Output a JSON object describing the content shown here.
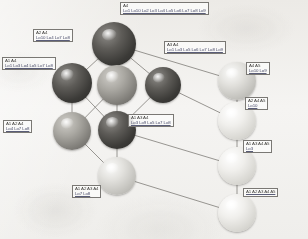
{
  "diagram": {
    "type": "hasse-lattice",
    "background_color": "#f3f2f0",
    "edge_color": "#8c8a86",
    "label_border_color": "#7a7874",
    "node_colors": {
      "dark": "#3b3a37",
      "mid": "#8a8883",
      "light": "#dedcd8",
      "pale": "#efeeeb"
    }
  },
  "nodes": [
    {
      "id": "n-top",
      "shade": "dark",
      "x": 114,
      "y": 44,
      "r": 22
    },
    {
      "id": "n-left-upper",
      "shade": "dark",
      "x": 72,
      "y": 83,
      "r": 20
    },
    {
      "id": "n-center-mid",
      "shade": "mid",
      "x": 117,
      "y": 85,
      "r": 20
    },
    {
      "id": "n-right-mid",
      "shade": "dark",
      "x": 163,
      "y": 85,
      "r": 18
    },
    {
      "id": "n-left-lower",
      "shade": "mid",
      "x": 72,
      "y": 131,
      "r": 19
    },
    {
      "id": "n-center-low",
      "shade": "dark",
      "x": 117,
      "y": 130,
      "r": 19
    },
    {
      "id": "n-bottom-mid",
      "shade": "light",
      "x": 117,
      "y": 176,
      "r": 19
    },
    {
      "id": "n-r1",
      "shade": "light",
      "x": 237,
      "y": 81,
      "r": 19
    },
    {
      "id": "n-r2",
      "shade": "pale",
      "x": 237,
      "y": 121,
      "r": 19
    },
    {
      "id": "n-r3",
      "shade": "pale",
      "x": 237,
      "y": 166,
      "r": 19
    },
    {
      "id": "n-r4",
      "shade": "pale",
      "x": 237,
      "y": 213,
      "r": 19
    }
  ],
  "edges": [
    {
      "from": "n-top",
      "to": "n-left-upper"
    },
    {
      "from": "n-top",
      "to": "n-center-mid"
    },
    {
      "from": "n-top",
      "to": "n-right-mid"
    },
    {
      "from": "n-top",
      "to": "n-r1"
    },
    {
      "from": "n-left-upper",
      "to": "n-left-lower"
    },
    {
      "from": "n-left-upper",
      "to": "n-center-low"
    },
    {
      "from": "n-center-mid",
      "to": "n-left-lower"
    },
    {
      "from": "n-center-mid",
      "to": "n-center-low"
    },
    {
      "from": "n-right-mid",
      "to": "n-center-low"
    },
    {
      "from": "n-right-mid",
      "to": "n-r2"
    },
    {
      "from": "n-left-lower",
      "to": "n-bottom-mid"
    },
    {
      "from": "n-center-low",
      "to": "n-bottom-mid"
    },
    {
      "from": "n-center-low",
      "to": "n-r3"
    },
    {
      "from": "n-bottom-mid",
      "to": "n-r4"
    },
    {
      "from": "n-r1",
      "to": "n-r2"
    },
    {
      "from": "n-r2",
      "to": "n-r3"
    },
    {
      "from": "n-r3",
      "to": "n-r4"
    }
  ],
  "labels": [
    {
      "id": "lbl-top",
      "node": "n-top",
      "attrs": "A4",
      "objs": "Lo1 Lo10 Lo2 Lo3 Lo4 Lo5 Lo6 Lo7 Lo8 Lo9",
      "x": 120,
      "y": 2
    },
    {
      "id": "lbl-a2a4",
      "node": "n-left-upper",
      "attrs": "A2 A4",
      "objs": "Lo10 Lo4 Lo7 Lo8",
      "x": 33,
      "y": 29
    },
    {
      "id": "lbl-a3a4",
      "node": "n-right-mid",
      "attrs": "A3 A4",
      "objs": "Lo1 Lo3 Lo5 Lo6 Lo7 Lo8 Lo9",
      "x": 164,
      "y": 41
    },
    {
      "id": "lbl-a1a4",
      "node": "n-left-upper",
      "attrs": "A1 A4",
      "objs": "Lo1 Lo3 Lo4 Lo5 Lo7 Lo8",
      "x": 2,
      "y": 57
    },
    {
      "id": "lbl-a4a5",
      "node": "n-r1",
      "attrs": "A4 A5",
      "objs": "Lo10 Lo9",
      "x": 246,
      "y": 62
    },
    {
      "id": "lbl-a2a4a5",
      "node": "n-r2",
      "attrs": "A2 A4 A5",
      "objs": "Lo10",
      "x": 245,
      "y": 97
    },
    {
      "id": "lbl-a1a3a4",
      "node": "n-center-low",
      "attrs": "A1 A3 A4",
      "objs": "Lo3 Lo9 Lo5 Lo7 Lo8",
      "x": 128,
      "y": 114
    },
    {
      "id": "lbl-a1a2a4",
      "node": "n-left-lower",
      "attrs": "A1 A2 A4",
      "objs": "Lo4 Lo7 Lo8",
      "x": 3,
      "y": 120
    },
    {
      "id": "lbl-a1a3a4a5",
      "node": "n-r3",
      "attrs": "A1 A3 A4 A5",
      "objs": "Lo3",
      "x": 243,
      "y": 140
    },
    {
      "id": "lbl-a1a2a3a4",
      "node": "n-bottom-mid",
      "attrs": "A1 A2 A3 A4",
      "objs": "Lo7 Lo8",
      "x": 72,
      "y": 185
    },
    {
      "id": "lbl-a1a2a3a4a5",
      "node": "n-r4",
      "attrs": "A1 A2 A3 A4 A5",
      "objs": "",
      "x": 243,
      "y": 188
    }
  ]
}
